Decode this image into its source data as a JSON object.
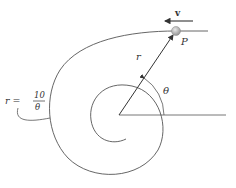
{
  "figure": {
    "type": "hyperbolic spiral motion diagram",
    "equation": {
      "lhs": "r =",
      "numerator": "10",
      "denominator": "θ"
    },
    "labels": {
      "velocity": "v",
      "particle": "P",
      "radius": "r",
      "angle": "θ"
    },
    "colors": {
      "line": "#555555",
      "particle": "#b8b8b8",
      "text": "#333333"
    }
  }
}
